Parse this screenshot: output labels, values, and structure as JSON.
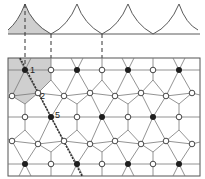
{
  "diagram": {
    "type": "lattice-with-periodic-potential",
    "colors": {
      "line": "#5a5a5a",
      "frame": "#555555",
      "shade": "#cfcfcf",
      "filled_node": "#1e1e1e",
      "open_node": "#ffffff",
      "dashed": "#333333"
    },
    "labels": [
      {
        "text": "1",
        "x": 30,
        "y": 73
      },
      {
        "text": "2",
        "x": 40,
        "y": 99
      },
      {
        "text": "5",
        "x": 55,
        "y": 118
      }
    ],
    "potential_curve": {
      "peaks_x": [
        25,
        77,
        128,
        179
      ],
      "troughs_x": [
        51,
        102,
        153
      ],
      "peak_y": 4,
      "trough_y": 34,
      "shaded_region": "first peak, left half-cell"
    },
    "rows": [
      {
        "y": 70,
        "filled_x": [
          25,
          77,
          128,
          179
        ],
        "open_x": [
          51,
          102,
          153
        ]
      },
      {
        "y": 117,
        "filled_x": [
          51,
          102,
          153
        ],
        "open_x": [
          25,
          77,
          128,
          179
        ]
      },
      {
        "y": 164,
        "filled_x": [
          25,
          77,
          128,
          179
        ],
        "open_x": [
          51,
          102,
          153
        ]
      }
    ],
    "zigzag_rows": [
      {
        "x": [
          12,
          38,
          64,
          90,
          115,
          141,
          166,
          192
        ],
        "y": [
          96,
          93,
          96,
          93,
          96,
          93,
          96,
          93
        ]
      },
      {
        "x": [
          12,
          38,
          64,
          90,
          115,
          141,
          166,
          192
        ],
        "y": [
          141,
          144,
          141,
          144,
          141,
          144,
          141,
          144
        ]
      }
    ]
  }
}
